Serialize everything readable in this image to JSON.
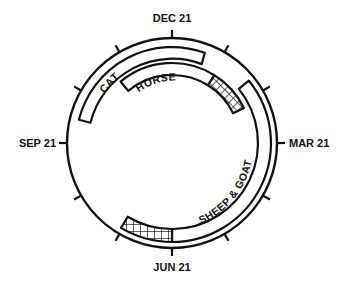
{
  "diagram": {
    "type": "seasonal-breeding-cycle",
    "axis_labels": {
      "top": "DEC 21",
      "right": "MAR 21",
      "bottom": "JUN 21",
      "left": "SEP 21"
    },
    "bands": [
      {
        "label": "CAT",
        "hatched": false
      },
      {
        "label": "HORSE",
        "hatched": true
      },
      {
        "label": "SHEEP & GOAT",
        "hatched": true
      }
    ],
    "colors": {
      "ink": "#111111",
      "background": "#ffffff"
    }
  }
}
